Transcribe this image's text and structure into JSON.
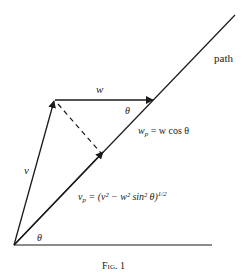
{
  "figure": {
    "caption": "Fig. 1",
    "labels": {
      "path": "path",
      "w": "w",
      "theta_top": "θ",
      "theta_bottom": "θ",
      "v": "v",
      "wp_eq": "w_p = w cos θ",
      "vp_eq": "v_p = (v² − w² sin² θ)^1/2"
    },
    "labels_rendered": {
      "wp_main": "w",
      "wp_sub": "p",
      "wp_rest": " = w cos θ",
      "vp_main": "v",
      "vp_sub": "p",
      "vp_rest": " = (v² − w² sin² θ)",
      "vp_exp": "1/2"
    },
    "colors": {
      "ink": "#1a1a1a",
      "background": "#ffffff"
    }
  }
}
